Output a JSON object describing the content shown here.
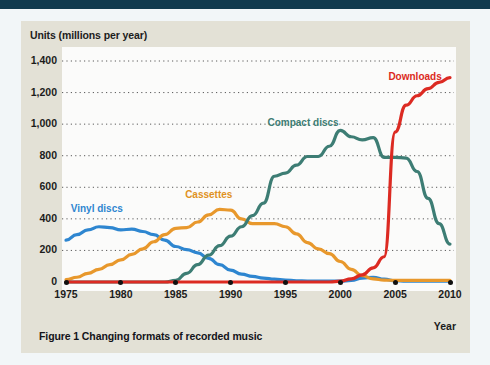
{
  "figure": {
    "caption": "Figure 1 Changing formats of recorded music",
    "card_bg": "#e3e1d6",
    "plot_bg": "#fbfbfa",
    "top_bar_color": "#113a4e"
  },
  "chart_data": {
    "type": "line",
    "title": "",
    "ylabel": "Units (millions per year)",
    "xlabel": "Year",
    "xlim": [
      1975,
      2010
    ],
    "ylim": [
      0,
      1400
    ],
    "grid": "horizontal-dotted",
    "legend": "inline-labels",
    "ytick_labels": [
      "1,400",
      "1,200",
      "1,000",
      "800",
      "600",
      "400",
      "200",
      "0"
    ],
    "ytick_values": [
      1400,
      1200,
      1000,
      800,
      600,
      400,
      200,
      0
    ],
    "xtick_labels": [
      "1975",
      "1980",
      "1985",
      "1990",
      "1995",
      "2000",
      "2005",
      "2010"
    ],
    "xtick_values": [
      1975,
      1980,
      1985,
      1990,
      1995,
      2000,
      2005,
      2010
    ],
    "x": [
      1975,
      1976,
      1977,
      1978,
      1979,
      1980,
      1981,
      1982,
      1983,
      1984,
      1985,
      1986,
      1987,
      1988,
      1989,
      1990,
      1991,
      1992,
      1993,
      1994,
      1995,
      1996,
      1997,
      1998,
      1999,
      2000,
      2001,
      2002,
      2003,
      2004,
      2005,
      2006,
      2007,
      2008,
      2009,
      2010
    ],
    "series": [
      {
        "name": "Vinyl discs",
        "color": "#2e86d0",
        "label_color": "#2e86d0",
        "values": [
          265,
          300,
          330,
          350,
          345,
          330,
          335,
          320,
          300,
          265,
          225,
          205,
          185,
          150,
          110,
          75,
          50,
          35,
          25,
          18,
          12,
          8,
          6,
          5,
          5,
          5,
          10,
          25,
          30,
          18,
          8,
          5,
          5,
          5,
          5,
          5
        ]
      },
      {
        "name": "Cassettes",
        "color": "#e8982c",
        "label_color": "#e0921f",
        "values": [
          15,
          30,
          55,
          80,
          110,
          140,
          175,
          210,
          255,
          300,
          340,
          345,
          380,
          425,
          460,
          455,
          400,
          370,
          370,
          370,
          350,
          305,
          250,
          210,
          180,
          130,
          80,
          40,
          20,
          12,
          10,
          10,
          10,
          10,
          10,
          10
        ]
      },
      {
        "name": "Compact discs",
        "color": "#3d7d74",
        "label_color": "#3d7d74",
        "values": [
          0,
          0,
          0,
          0,
          0,
          0,
          0,
          0,
          0,
          0,
          10,
          55,
          110,
          170,
          230,
          290,
          350,
          420,
          500,
          670,
          690,
          740,
          795,
          795,
          860,
          960,
          920,
          900,
          915,
          790,
          790,
          785,
          700,
          530,
          370,
          240
        ]
      },
      {
        "name": "Downloads",
        "color": "#dc2a22",
        "label_color": "#dc2a22",
        "values": [
          0,
          0,
          0,
          0,
          0,
          0,
          0,
          0,
          0,
          0,
          0,
          0,
          0,
          0,
          0,
          0,
          0,
          0,
          0,
          0,
          0,
          0,
          0,
          0,
          0,
          5,
          20,
          45,
          90,
          160,
          950,
          1120,
          1180,
          1225,
          1265,
          1295
        ]
      }
    ],
    "annotations": [
      {
        "text": "Vinyl discs",
        "x": 1977.8,
        "y": 455
      },
      {
        "text": "Cassettes",
        "x": 1988.0,
        "y": 545
      },
      {
        "text": "Compact discs",
        "x": 1996.6,
        "y": 1000
      },
      {
        "text": "Downloads",
        "x": 2006.8,
        "y": 1290
      }
    ]
  }
}
